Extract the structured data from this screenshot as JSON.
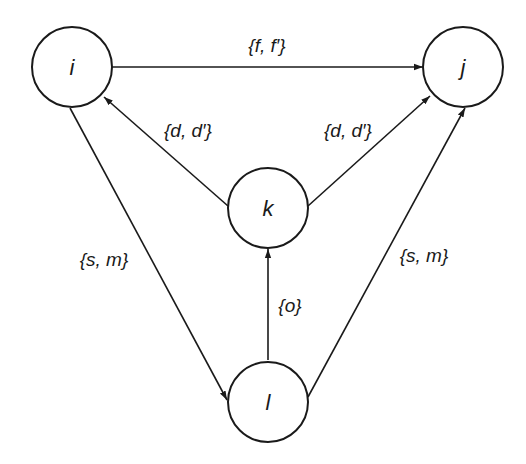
{
  "diagram": {
    "type": "directed-graph",
    "nodes": [
      {
        "id": "i",
        "label": "i",
        "cx": 72,
        "cy": 67
      },
      {
        "id": "j",
        "label": "j",
        "cx": 463,
        "cy": 67
      },
      {
        "id": "k",
        "label": "k",
        "cx": 268,
        "cy": 208
      },
      {
        "id": "l",
        "label": "l",
        "cx": 268,
        "cy": 402
      }
    ],
    "node_radius": 40,
    "edges": [
      {
        "from": "i",
        "to": "j",
        "label": "{f, f′}"
      },
      {
        "from": "k",
        "to": "i",
        "label": "{d, d′}"
      },
      {
        "from": "k",
        "to": "j",
        "label": "{d, d′}"
      },
      {
        "from": "i",
        "to": "l",
        "label": "{s, m}"
      },
      {
        "from": "l",
        "to": "j",
        "label": "{s, m}"
      },
      {
        "from": "l",
        "to": "k",
        "label": "{o}"
      }
    ],
    "labels": {
      "node_i": "i",
      "node_j": "j",
      "node_k": "k",
      "node_l": "l",
      "edge_ij": "{f, f′}",
      "edge_ki": "{d, d′}",
      "edge_kj": "{d, d′}",
      "edge_il": "{s, m}",
      "edge_lj": "{s, m}",
      "edge_lk": "{o}"
    }
  }
}
